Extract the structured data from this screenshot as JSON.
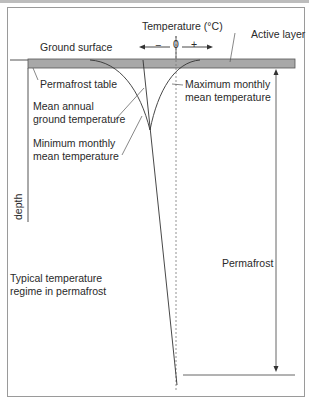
{
  "diagram": {
    "title": "Typical temperature regime in permafrost",
    "title_lines": [
      "Typical temperature",
      "regime in permafrost"
    ],
    "axis": {
      "label": "Temperature (°C)",
      "minus": "−",
      "zero": "0",
      "plus": "+",
      "depth_label": "depth"
    },
    "labels": {
      "ground_surface": "Ground surface",
      "active_layer": "Active layer",
      "permafrost_table": "Permafrost table",
      "max_monthly": [
        "Maximum monthly",
        "mean temperature"
      ],
      "mean_annual": [
        "Mean annual",
        "ground temperature"
      ],
      "min_monthly": [
        "Minimum monthly",
        "mean temperature"
      ],
      "permafrost": "Permafrost"
    },
    "colors": {
      "active_layer_fill": "#a8a8a8",
      "line": "#555555",
      "frame": "#9a9a9a"
    }
  }
}
